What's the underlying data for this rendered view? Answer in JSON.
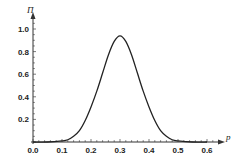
{
  "chart_data": {
    "type": "line",
    "title": "",
    "xlabel": "p",
    "ylabel": "Π",
    "xlim": [
      0.0,
      0.6
    ],
    "ylim": [
      0.0,
      1.0
    ],
    "x_ticks": [
      "0.0",
      "0.1",
      "0.2",
      "0.3",
      "0.4",
      "0.5",
      "0.6"
    ],
    "y_ticks": [
      "0.2",
      "0.4",
      "0.6",
      "0.8",
      "1.0"
    ],
    "grid": false,
    "legend": null,
    "series": [
      {
        "name": "Π(p)",
        "x": [
          0.0,
          0.05,
          0.1,
          0.12,
          0.14,
          0.16,
          0.18,
          0.2,
          0.22,
          0.24,
          0.26,
          0.28,
          0.3,
          0.32,
          0.34,
          0.36,
          0.38,
          0.4,
          0.42,
          0.44,
          0.46,
          0.48,
          0.5,
          0.55,
          0.6
        ],
        "values": [
          0.0,
          0.0,
          0.01,
          0.02,
          0.05,
          0.1,
          0.19,
          0.31,
          0.45,
          0.61,
          0.77,
          0.89,
          0.94,
          0.89,
          0.77,
          0.61,
          0.45,
          0.31,
          0.19,
          0.1,
          0.05,
          0.02,
          0.01,
          0.0,
          0.0
        ]
      }
    ],
    "line_color": "#222222"
  }
}
